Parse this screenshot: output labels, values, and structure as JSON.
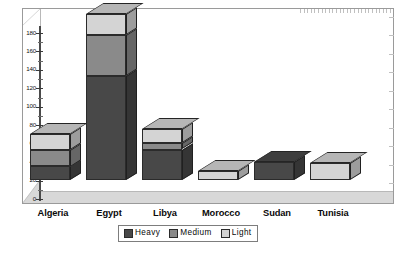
{
  "chart_data": {
    "type": "bar",
    "subtype": "stacked-column-3d",
    "title": "",
    "xlabel": "",
    "ylabel": "",
    "ylim": [
      0,
      180
    ],
    "ytick_step": 20,
    "grid": false,
    "legend_position": "bottom",
    "categories": [
      "Algeria",
      "Egypt",
      "Libya",
      "Morocco",
      "Sudan",
      "Tunisia"
    ],
    "ytick_labels": [
      "0",
      "20",
      "40",
      "60",
      "80",
      "100",
      "120",
      "140",
      "160",
      "180"
    ],
    "series": [
      {
        "name": "Heavy",
        "color": "#484848",
        "values": [
          15,
          113,
          33,
          0,
          20,
          0
        ]
      },
      {
        "name": "Medium",
        "color": "#8a8a8a",
        "values": [
          18,
          44,
          7,
          0,
          0,
          0
        ]
      },
      {
        "name": "Light",
        "color": "#d4d4d4",
        "values": [
          17,
          23,
          15,
          10,
          0,
          18
        ]
      }
    ],
    "totals": [
      50,
      180,
      55,
      10,
      20,
      18
    ]
  },
  "legend": {
    "items": [
      {
        "label": "Heavy",
        "color": "#484848"
      },
      {
        "label": "Medium",
        "color": "#8a8a8a"
      },
      {
        "label": "Light",
        "color": "#d4d4d4"
      }
    ]
  },
  "style": {
    "floor_color": "#d8d8d8",
    "wall_color": "#ffffff",
    "frame_color": "#9a9a9a",
    "axis_color": "#3a3a3a",
    "text_color": "#0a0a0a"
  }
}
